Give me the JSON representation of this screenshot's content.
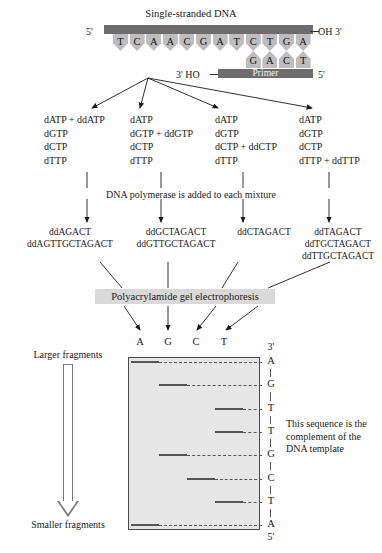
{
  "figure": {
    "template_title": "Single-stranded DNA",
    "template_bases": [
      "T",
      "C",
      "A",
      "A",
      "C",
      "G",
      "A",
      "T",
      "C",
      "T",
      "G",
      "A"
    ],
    "primer_bases": [
      "G",
      "A",
      "C",
      "T"
    ],
    "primer_label": "Primer",
    "five_prime_left": "5'",
    "three_prime_oh": "OH 3'",
    "three_prime_ho": "3' HO",
    "five_prime_right": "5'"
  },
  "mixtures": [
    {
      "lines": [
        "dATP + ddATP",
        "dGTP",
        "dCTP",
        "dTTP"
      ]
    },
    {
      "lines": [
        "dATP",
        "dGTP + ddGTP",
        "dCTP",
        "dTTP"
      ]
    },
    {
      "lines": [
        "dATP",
        "dGTP",
        "dCTP + ddCTP",
        "dTTP"
      ]
    },
    {
      "lines": [
        "dATP",
        "dGTP",
        "dCTP",
        "dTTP + ddTTP"
      ]
    }
  ],
  "polymerase_step": "DNA polymerase is added to each mixture",
  "fragments": [
    {
      "lines": [
        "ddAGACT",
        "ddAGTTGCTAGACT"
      ]
    },
    {
      "lines": [
        "ddGCTAGACT",
        "ddGTTGCTAGACT"
      ]
    },
    {
      "lines": [
        "ddCTAGACT"
      ]
    },
    {
      "lines": [
        "ddTAGACT",
        "ddTGCTAGACT",
        "ddTTGCTAGACT"
      ]
    }
  ],
  "gel_label": "Polyacrylamide gel electrophoresis",
  "lane_headers": [
    "A",
    "G",
    "C",
    "T"
  ],
  "gel": {
    "top_marker": "3'",
    "bottom_marker": "5'",
    "bands": [
      {
        "base": "A",
        "lane": 0
      },
      {
        "base": "G",
        "lane": 1
      },
      {
        "base": "T",
        "lane": 3
      },
      {
        "base": "T",
        "lane": 3
      },
      {
        "base": "G",
        "lane": 1
      },
      {
        "base": "C",
        "lane": 2
      },
      {
        "base": "T",
        "lane": 3
      },
      {
        "base": "A",
        "lane": 0
      }
    ]
  },
  "left_axis": {
    "top_label": "Larger fragments",
    "bottom_label": "Smaller fragments"
  },
  "note": "This sequence is the complement of the DNA template",
  "colors": {
    "strand_bar": "#6d6d6d",
    "base_tooth": "#bdbdbd",
    "gel_fill": "#e6e6e6",
    "highlight": "#d9d9d9"
  }
}
